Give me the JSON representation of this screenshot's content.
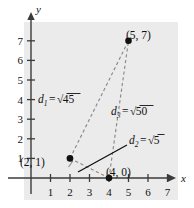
{
  "figure": {
    "background_color": "#ebebeb",
    "axis_color": "#3b3b3b",
    "dash_color": "#8a8a8a",
    "point_color": "#111111",
    "axes": {
      "x_name": "x",
      "y_name": "y",
      "x_ticks": [
        "1",
        "2",
        "3",
        "4",
        "5",
        "6",
        "7"
      ],
      "y_ticks": [
        "1",
        "2",
        "3",
        "4",
        "5",
        "6",
        "7"
      ],
      "x_range": [
        -0.55,
        7.9
      ],
      "y_range": [
        -0.75,
        7.9
      ]
    },
    "points": [
      {
        "name": "point-5-7",
        "label": "(5, 7)",
        "x": 5,
        "y": 7
      },
      {
        "name": "point-2-1",
        "label": "(2, 1)",
        "x": 2,
        "y": 1
      },
      {
        "name": "point-4-0",
        "label": "(4, 0)",
        "x": 4,
        "y": 0
      }
    ],
    "distances": [
      {
        "name": "d1",
        "var": "d",
        "sub": "1",
        "eq": "=",
        "radical": "√",
        "value": "45",
        "full": "d₁ = √45"
      },
      {
        "name": "d3",
        "var": "d",
        "sub": "3",
        "eq": "=",
        "radical": "√",
        "value": "50",
        "full": "d₃ = √50"
      },
      {
        "name": "d2",
        "var": "d",
        "sub": "2",
        "eq": "=",
        "radical": "√",
        "value": "5",
        "full": "d₂ = √5"
      }
    ],
    "right_angle_marker": {
      "at_point": "(2, 1)"
    }
  },
  "chart_data": {
    "type": "scatter",
    "title": "",
    "xlabel": "x",
    "ylabel": "y",
    "xlim": [
      -0.55,
      7.9
    ],
    "ylim": [
      -0.75,
      7.9
    ],
    "grid": false,
    "xticks": [
      1,
      2,
      3,
      4,
      5,
      6,
      7
    ],
    "yticks": [
      1,
      2,
      3,
      4,
      5,
      6,
      7
    ],
    "points": [
      {
        "label": "(2, 1)",
        "x": 2,
        "y": 1
      },
      {
        "label": "(4, 0)",
        "x": 4,
        "y": 0
      },
      {
        "label": "(5, 7)",
        "x": 5,
        "y": 7
      }
    ],
    "segments": [
      {
        "name": "d1",
        "from": [
          2,
          1
        ],
        "to": [
          5,
          7
        ],
        "style": "dashed",
        "label": "d1 = √45"
      },
      {
        "name": "d2",
        "from": [
          2,
          1
        ],
        "to": [
          4,
          0
        ],
        "style": "dashed",
        "label": "d2 = √5"
      },
      {
        "name": "d3",
        "from": [
          4,
          0
        ],
        "to": [
          5,
          7
        ],
        "style": "dashed",
        "label": "d3 = √50"
      }
    ],
    "annotations": [
      "right angle at (2, 1)"
    ]
  }
}
